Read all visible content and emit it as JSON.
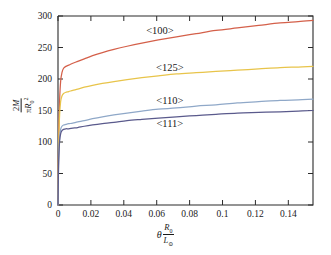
{
  "figure": {
    "background_color": "#ffffff",
    "axis_color": "#2b2b2b"
  },
  "xlabel_parts": {
    "theta": "θ",
    "numerator": "R",
    "numerator_sub": "0",
    "denominator": "L",
    "denominator_sub": "⊙"
  },
  "ylabel_parts": {
    "numerator_coeff": "2",
    "numerator_sym": "M",
    "denominator_pi": "π",
    "denominator_sym": "R",
    "denominator_sub": "0",
    "denominator_sup": "2"
  },
  "chart_data": {
    "type": "line",
    "title": "",
    "subtitle": "",
    "xlabel": "θ R₀/L☉",
    "ylabel": "2M/πR₀²",
    "xlim": [
      0,
      0.155
    ],
    "ylim": [
      0,
      300
    ],
    "xticks": [
      0,
      0.02,
      0.04,
      0.06,
      0.08,
      0.1,
      0.12,
      0.14
    ],
    "xticklabels": [
      "0",
      "0.02",
      "0.04",
      "0.06",
      "0.08",
      "0.1",
      "0.12",
      "0.14"
    ],
    "yticks": [
      0,
      50,
      100,
      150,
      200,
      250,
      300
    ],
    "yticklabels": [
      "0",
      "50",
      "100",
      "150",
      "200",
      "250",
      "300"
    ],
    "grid": false,
    "legend": "none",
    "annotations": [
      {
        "text": "<100>",
        "x": 0.062,
        "y": 272,
        "color": "#1a1a1a"
      },
      {
        "text": "<125>",
        "x": 0.068,
        "y": 213,
        "color": "#1a1a1a"
      },
      {
        "text": "<110>",
        "x": 0.068,
        "y": 160,
        "color": "#1a1a1a"
      },
      {
        "text": "<111>",
        "x": 0.068,
        "y": 124,
        "color": "#1a1a1a"
      }
    ],
    "series": [
      {
        "name": "<100>",
        "color": "#d4604a",
        "x": [
          0,
          0.0002,
          0.0005,
          0.001,
          0.0016,
          0.0024,
          0.0034,
          0.0048,
          0.0065,
          0.009,
          0.012,
          0.016,
          0.021,
          0.027,
          0.034,
          0.042,
          0.051,
          0.061,
          0.072,
          0.084,
          0.096,
          0.109,
          0.122,
          0.135,
          0.146,
          0.155
        ],
        "y": [
          0,
          62,
          118,
          168,
          196,
          210,
          217,
          220,
          222,
          225,
          228,
          232,
          237,
          242,
          247,
          252,
          257,
          262,
          267,
          272,
          277,
          281,
          285,
          289,
          291,
          293
        ]
      },
      {
        "name": "<125>",
        "color": "#e8c44a",
        "x": [
          0,
          0.0002,
          0.0005,
          0.001,
          0.0016,
          0.0024,
          0.0034,
          0.0048,
          0.0065,
          0.009,
          0.012,
          0.016,
          0.021,
          0.027,
          0.034,
          0.042,
          0.051,
          0.061,
          0.072,
          0.084,
          0.096,
          0.109,
          0.122,
          0.135,
          0.146,
          0.155
        ],
        "y": [
          0,
          56,
          104,
          144,
          164,
          173,
          177,
          179,
          180,
          182,
          184,
          187,
          190,
          193,
          196,
          199,
          202,
          205,
          208,
          210,
          212,
          214,
          216,
          218,
          219,
          220
        ]
      },
      {
        "name": "<110>",
        "color": "#8fa8c8",
        "x": [
          0,
          0.0002,
          0.0005,
          0.001,
          0.0016,
          0.0024,
          0.0034,
          0.0048,
          0.0065,
          0.009,
          0.012,
          0.016,
          0.021,
          0.027,
          0.034,
          0.042,
          0.051,
          0.061,
          0.072,
          0.084,
          0.096,
          0.109,
          0.122,
          0.135,
          0.146,
          0.155
        ],
        "y": [
          0,
          44,
          80,
          108,
          120,
          125,
          127,
          128,
          129,
          130,
          132,
          134,
          137,
          140,
          143,
          146,
          149,
          152,
          154,
          157,
          159,
          162,
          164,
          166,
          167,
          168
        ]
      },
      {
        "name": "<111>",
        "color": "#5a5a8c",
        "x": [
          0,
          0.0002,
          0.0005,
          0.001,
          0.0016,
          0.0024,
          0.0034,
          0.0048,
          0.0065,
          0.009,
          0.012,
          0.016,
          0.021,
          0.027,
          0.034,
          0.042,
          0.051,
          0.061,
          0.072,
          0.084,
          0.096,
          0.109,
          0.122,
          0.135,
          0.146,
          0.155
        ],
        "y": [
          0,
          42,
          76,
          102,
          113,
          118,
          120,
          121,
          121,
          122,
          123,
          125,
          127,
          129,
          131,
          134,
          136,
          138,
          140,
          142,
          144,
          146,
          147,
          148,
          149,
          150
        ]
      }
    ]
  }
}
